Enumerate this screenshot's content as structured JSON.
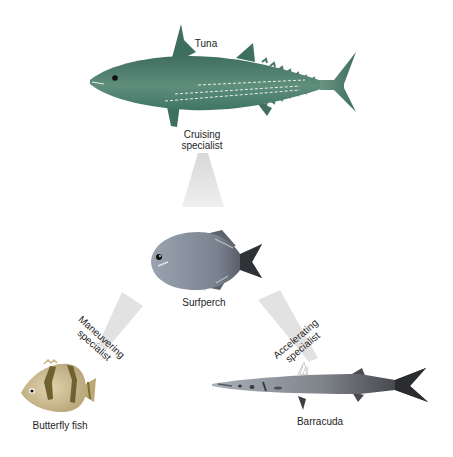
{
  "diagram": {
    "type": "fish-body-form-specialization",
    "nodes": [
      {
        "id": "tuna",
        "label": "Tuna",
        "color": "#4f7f6d"
      },
      {
        "id": "surfperch",
        "label": "Surfperch",
        "color": "#7f8793"
      },
      {
        "id": "butterfly",
        "label": "Butterfly fish",
        "color": "#c7b58a"
      },
      {
        "id": "barracuda",
        "label": "Barracuda",
        "color": "#6b6e72"
      }
    ],
    "edges": [
      {
        "from": "surfperch",
        "to": "tuna",
        "label_line1": "Cruising",
        "label_line2": "specialist"
      },
      {
        "from": "surfperch",
        "to": "butterfly",
        "label_line1": "Maneuvering",
        "label_line2": "specialist"
      },
      {
        "from": "surfperch",
        "to": "barracuda",
        "label_line1": "Accelerating",
        "label_line2": "specialist"
      }
    ]
  },
  "colors": {
    "background": "#ffffff",
    "beam": "#e3e3e3",
    "text": "#1e1e1e"
  }
}
